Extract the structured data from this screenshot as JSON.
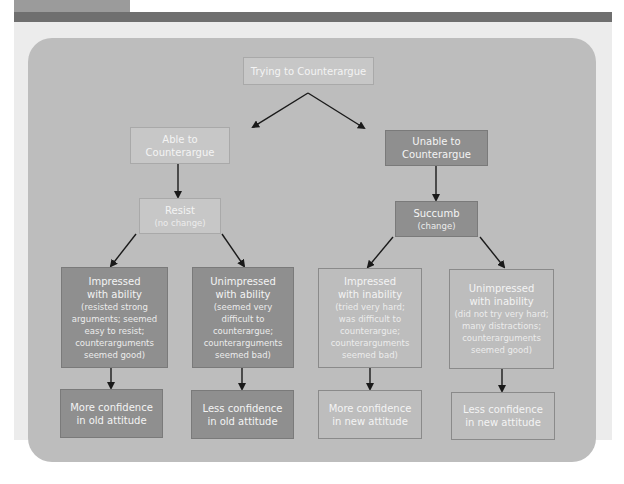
{
  "diagram": {
    "root": {
      "label": "Trying to Counterargue"
    },
    "branches": [
      {
        "label": "Able to Counterargue",
        "label_lines": [
          "Able to",
          "Counterargue"
        ],
        "outcome": {
          "title": "Resist",
          "sub": "(no change)"
        },
        "leaves": [
          {
            "title_lines": [
              "Impressed",
              "with ability"
            ],
            "detail_lines": [
              "(resisted strong",
              "arguments; seemed",
              "easy to resist;",
              "counterarguments",
              "seemed good)"
            ],
            "result_lines": [
              "More confidence",
              "in old attitude"
            ]
          },
          {
            "title_lines": [
              "Unimpressed",
              "with ability"
            ],
            "detail_lines": [
              "(seemed very",
              "difficult to",
              "counterargue;",
              "counterarguments",
              "seemed bad)"
            ],
            "result_lines": [
              "Less confidence",
              "in old attitude"
            ]
          }
        ]
      },
      {
        "label": "Unable to Counterargue",
        "label_lines": [
          "Unable to",
          "Counterargue"
        ],
        "outcome": {
          "title": "Succumb",
          "sub": "(change)"
        },
        "leaves": [
          {
            "title_lines": [
              "Impressed",
              "with inability"
            ],
            "detail_lines": [
              "(tried very hard;",
              "was difficult to",
              "counterargue;",
              "counterarguments",
              "seemed bad)"
            ],
            "result_lines": [
              "More confidence",
              "in new attitude"
            ]
          },
          {
            "title_lines": [
              "Unimpressed",
              "with inability"
            ],
            "detail_lines": [
              "(did not try very hard;",
              "many distractions;",
              "counterarguments",
              "seemed good)"
            ],
            "result_lines": [
              "Less confidence",
              "in new attitude"
            ]
          }
        ]
      }
    ]
  },
  "colors": {
    "header_band": "#6f6f6f",
    "sheet_bg": "#ececec",
    "panel_bg": "#bdbdbd",
    "box_dark": "#8f8f8f",
    "box_mid": "#a9a9a9",
    "box_light": "#c7c7c7",
    "arrow": "#1a1a1a"
  }
}
